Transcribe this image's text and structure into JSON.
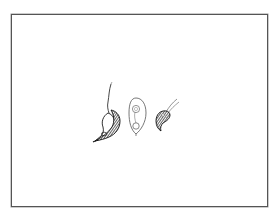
{
  "figure": {
    "frame_color": "#555555",
    "ink_color": "#1a1a1a",
    "background": "#ffffff",
    "organisms": [
      {
        "id": "organism-1",
        "shape": "flagellated leaf-shaped cell with dark shaded side"
      },
      {
        "id": "organism-2",
        "shape": "outlined ovoid cell with internal circles"
      },
      {
        "id": "organism-3",
        "shape": "small dark comma-shaped cell with two flagella"
      }
    ]
  }
}
